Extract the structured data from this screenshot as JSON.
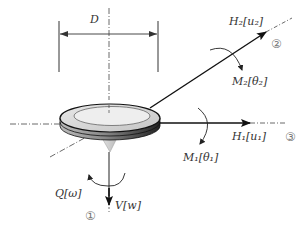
{
  "diagram": {
    "colors": {
      "line": "#222222",
      "axis": "#444444",
      "disc_top": "#d9d9d9",
      "disc_inner": "#eeeeee",
      "disc_side": "#555555",
      "label": "#333333",
      "circled_number": "#777777"
    },
    "labels": {
      "diameter": "D",
      "h2": "H₂[u₂]",
      "m2": "M₂[θ₂]",
      "h1": "H₁[u₁]",
      "m1": "M₁[θ₁]",
      "q": "Q[ω]",
      "v": "V[w]"
    },
    "axes": {
      "axis_1": "①",
      "axis_2": "②",
      "axis_3": "③"
    }
  }
}
